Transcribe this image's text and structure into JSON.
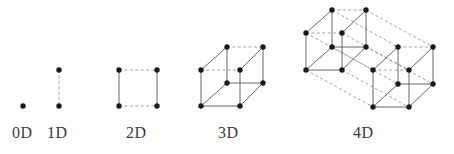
{
  "figure": {
    "title_visible": false,
    "background_color": "#ffffff",
    "vertex_color": "#1a1a1a",
    "solid_edge_color": "#555555",
    "dashed_edge_color": "#9a9a9a",
    "label_color": "#3a3a3a"
  },
  "labels": [
    {
      "text": "0D",
      "x": 12,
      "y": 124
    },
    {
      "text": "1D",
      "x": 47,
      "y": 124
    },
    {
      "text": "2D",
      "x": 126,
      "y": 124
    },
    {
      "text": "3D",
      "x": 218,
      "y": 124
    },
    {
      "text": "4D",
      "x": 353,
      "y": 124
    }
  ],
  "chart_data": {
    "type": "diagram",
    "title": "",
    "panels": [
      {
        "name": "0D",
        "label": "0D",
        "vertices": 1,
        "edges": 0,
        "points": [
          {
            "x": 23,
            "y": 106
          }
        ],
        "solid_edges": [],
        "dashed_edges": []
      },
      {
        "name": "1D",
        "label": "1D",
        "vertices": 2,
        "edges": 1,
        "points": [
          {
            "x": 59,
            "y": 70
          },
          {
            "x": 59,
            "y": 106
          }
        ],
        "solid_edges": [],
        "dashed_edges": [
          [
            0,
            1
          ]
        ]
      },
      {
        "name": "2D",
        "label": "2D",
        "vertices": 4,
        "edges": 4,
        "points": [
          {
            "x": 119,
            "y": 70
          },
          {
            "x": 157,
            "y": 70
          },
          {
            "x": 157,
            "y": 106
          },
          {
            "x": 119,
            "y": 106
          }
        ],
        "solid_edges": [
          [
            0,
            3
          ],
          [
            1,
            2
          ]
        ],
        "dashed_edges": [
          [
            0,
            1
          ],
          [
            3,
            2
          ]
        ]
      },
      {
        "name": "3D",
        "label": "3D",
        "vertices": 8,
        "edges": 12,
        "points": [
          {
            "x": 201,
            "y": 70
          },
          {
            "x": 240,
            "y": 70
          },
          {
            "x": 240,
            "y": 106
          },
          {
            "x": 201,
            "y": 106
          },
          {
            "x": 227,
            "y": 47
          },
          {
            "x": 263,
            "y": 47
          },
          {
            "x": 263,
            "y": 83
          },
          {
            "x": 227,
            "y": 83
          }
        ],
        "solid_edges": [
          [
            0,
            3
          ],
          [
            1,
            2
          ],
          [
            3,
            2
          ],
          [
            4,
            7
          ],
          [
            5,
            6
          ],
          [
            7,
            6
          ],
          [
            0,
            4
          ],
          [
            1,
            5
          ],
          [
            3,
            7
          ],
          [
            2,
            6
          ]
        ],
        "dashed_edges": [
          [
            0,
            1
          ],
          [
            4,
            5
          ]
        ]
      },
      {
        "name": "4D",
        "label": "4D",
        "vertices": 16,
        "edges": 32,
        "points": [
          {
            "x": 306,
            "y": 33
          },
          {
            "x": 342,
            "y": 33
          },
          {
            "x": 342,
            "y": 70
          },
          {
            "x": 306,
            "y": 70
          },
          {
            "x": 332,
            "y": 10
          },
          {
            "x": 366,
            "y": 10
          },
          {
            "x": 366,
            "y": 47
          },
          {
            "x": 332,
            "y": 47
          },
          {
            "x": 373,
            "y": 70
          },
          {
            "x": 409,
            "y": 70
          },
          {
            "x": 409,
            "y": 107
          },
          {
            "x": 373,
            "y": 107
          },
          {
            "x": 398,
            "y": 47
          },
          {
            "x": 433,
            "y": 47
          },
          {
            "x": 433,
            "y": 84
          },
          {
            "x": 398,
            "y": 84
          }
        ],
        "solid_edges": [
          [
            0,
            3
          ],
          [
            1,
            2
          ],
          [
            3,
            2
          ],
          [
            4,
            7
          ],
          [
            5,
            6
          ],
          [
            7,
            6
          ],
          [
            0,
            4
          ],
          [
            1,
            5
          ],
          [
            3,
            7
          ],
          [
            2,
            6
          ],
          [
            8,
            11
          ],
          [
            9,
            10
          ],
          [
            11,
            10
          ],
          [
            12,
            15
          ],
          [
            13,
            14
          ],
          [
            15,
            14
          ],
          [
            8,
            12
          ],
          [
            9,
            13
          ],
          [
            11,
            15
          ],
          [
            10,
            14
          ]
        ],
        "dashed_edges": [
          [
            0,
            1
          ],
          [
            4,
            5
          ],
          [
            8,
            9
          ],
          [
            12,
            13
          ],
          [
            0,
            8
          ],
          [
            1,
            9
          ],
          [
            2,
            10
          ],
          [
            3,
            11
          ],
          [
            4,
            12
          ],
          [
            5,
            13
          ],
          [
            6,
            14
          ],
          [
            7,
            15
          ]
        ]
      }
    ]
  }
}
